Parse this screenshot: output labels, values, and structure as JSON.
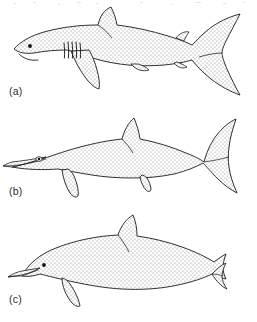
{
  "figure": {
    "type": "scientific-line-illustration",
    "background_color": "#ffffff",
    "outline_color": "#1a1a1a",
    "stipple_color": "#8a8a8a",
    "fill_color": "#ffffff",
    "panels": [
      {
        "label": "(a)",
        "subject": "shark",
        "features": [
          "pointed snout",
          "round black eye",
          "ventral crescent mouth",
          "five vertical gill slits",
          "triangular first dorsal fin",
          "small second dorsal fin",
          "pectoral fin",
          "pelvic fin",
          "anal fin",
          "heterocercal tail with enlarged upper lobe"
        ],
        "tail_type": "heterocercal-vertical"
      },
      {
        "label": "(b)",
        "subject": "ichthyosaur",
        "features": [
          "long narrow pointed rostrum",
          "large eye",
          "triangular dorsal fin",
          "front paddle flipper",
          "rear paddle flipper",
          "symmetrical crescent caudal fin"
        ],
        "tail_type": "homocercal-vertical-crescent"
      },
      {
        "label": "(c)",
        "subject": "dolphin",
        "features": [
          "bulbous melon forehead",
          "short beak",
          "small round black eye",
          "falcate dorsal fin",
          "curved pointed pectoral flipper",
          "horizontal tail flukes seen edge-on"
        ],
        "tail_type": "horizontal-flukes"
      }
    ]
  }
}
